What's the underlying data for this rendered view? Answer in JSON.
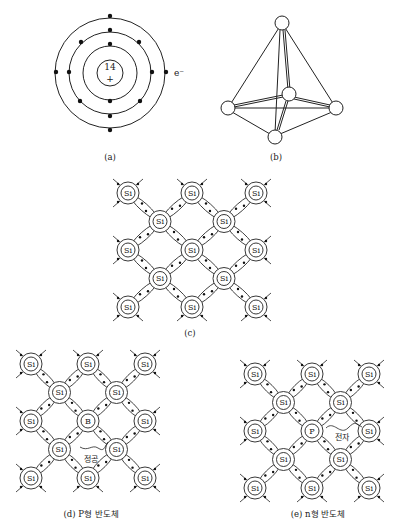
{
  "panels": {
    "a": {
      "label": "(a)",
      "nucleus_number": "14",
      "nucleus_charge": "+",
      "electron_label": "e⁻",
      "shells": [
        2,
        8,
        4
      ]
    },
    "b": {
      "label": "(b)"
    },
    "c": {
      "label": "(c)",
      "atom_symbol": "Si"
    },
    "d": {
      "label": "(d) P형 반도체",
      "atom_symbol": "Si",
      "dopant_symbol": "B",
      "annotation": "정공"
    },
    "e": {
      "label": "(e) n형 반도체",
      "atom_symbol": "Si",
      "dopant_symbol": "P",
      "annotation": "전자"
    }
  },
  "colors": {
    "line": "#222222",
    "background": "#ffffff"
  }
}
